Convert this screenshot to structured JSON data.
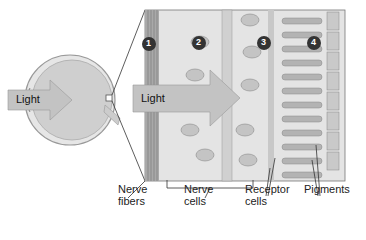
{
  "diagram": {
    "eye_arrow_label": "Light",
    "retina_arrow_label": "Light",
    "markers": [
      "1",
      "2",
      "3",
      "4"
    ],
    "labels": [
      {
        "id": "nerve-fibers",
        "line1": "Nerve",
        "line2": "fibers"
      },
      {
        "id": "nerve-cells",
        "line1": "Nerve",
        "line2": "cells"
      },
      {
        "id": "receptor-cells",
        "line1": "Receptor",
        "line2": "cells"
      },
      {
        "id": "pigments",
        "line1": "Pigments",
        "line2": ""
      }
    ],
    "colors": {
      "tissue": "#d9d9d9",
      "cell": "#bdbdbd",
      "marker": "#333333",
      "arrow": "#bfbfbf"
    }
  }
}
